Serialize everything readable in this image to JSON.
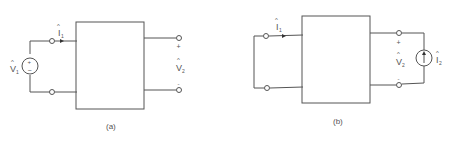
{
  "figures": [
    {
      "id": "a",
      "caption": "(a)",
      "labels": {
        "input_current": "I",
        "input_current_sub": "1",
        "source_voltage": "V",
        "source_voltage_sub": "1",
        "output_voltage": "V",
        "output_voltage_sub": "2",
        "plus": "+",
        "minus": "-",
        "hat": "^",
        "src_plus": "+",
        "src_minus": "−"
      },
      "source_type": "voltage-source",
      "output": "open-circuit"
    },
    {
      "id": "b",
      "caption": "(b)",
      "labels": {
        "input_current": "I",
        "input_current_sub": "1",
        "output_voltage": "V",
        "output_voltage_sub": "2",
        "output_current": "I",
        "output_current_sub": "2",
        "plus": "+",
        "minus": "-",
        "hat": "^"
      },
      "source_type": "current-source",
      "input": "short-circuit"
    }
  ],
  "colors": {
    "line": "#555555",
    "background": "#ffffff"
  }
}
